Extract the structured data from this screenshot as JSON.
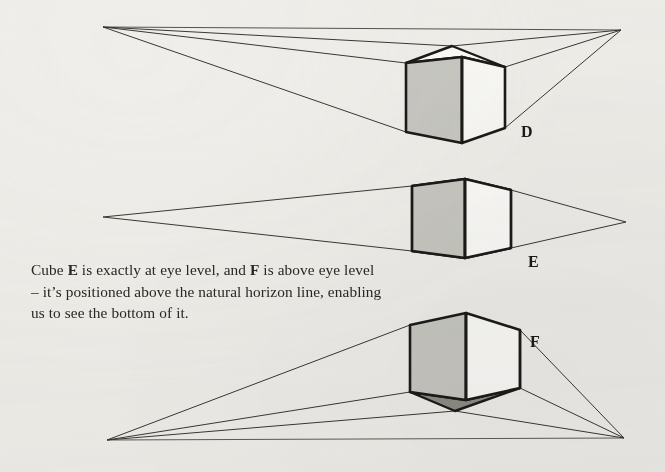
{
  "page": {
    "background_color": "#f2f1ee",
    "width": 665,
    "height": 472,
    "ink_color": "#1d1b19"
  },
  "caption": {
    "line1_a": "Cube ",
    "line1_b": "E",
    "line1_c": " is exactly at eye level, and ",
    "line1_d": "F",
    "line1_e": " is above eye",
    "line2": "level – it’s positioned above the natural horizon",
    "line3": "line, enabling us to see the bottom of it.",
    "full_text": "Cube E is exactly at eye level, and F is above eye level – it’s positioned above the natural horizon line, enabling us to see the bottom of it."
  },
  "figures": [
    {
      "id": "D",
      "label": "D",
      "label_x": 521,
      "label_y": 123,
      "description": "cube below eye level, top face visible",
      "left_vanishing_point": {
        "x": 103,
        "y": 27
      },
      "right_vanishing_point": {
        "x": 621,
        "y": 30
      },
      "cube": {
        "front_top": {
          "x": 462,
          "y": 57
        },
        "front_bottom": {
          "x": 462,
          "y": 143
        },
        "left_top": {
          "x": 406,
          "y": 63
        },
        "left_bottom": {
          "x": 406,
          "y": 132
        },
        "right_top": {
          "x": 505,
          "y": 67
        },
        "right_bottom": {
          "x": 505,
          "y": 128
        },
        "back_top": {
          "x": 452,
          "y": 46
        },
        "left_face_fill": "#c9c9c4",
        "right_face_fill": "#fbfbf9",
        "top_face_fill": "#fdfdfc",
        "bottom_face_fill": null
      }
    },
    {
      "id": "E",
      "label": "E",
      "label_x": 528,
      "label_y": 253,
      "description": "cube exactly at eye level, neither top nor bottom visible",
      "left_vanishing_point": {
        "x": 103,
        "y": 217
      },
      "right_vanishing_point": {
        "x": 626,
        "y": 222
      },
      "cube": {
        "front_top": {
          "x": 465,
          "y": 179
        },
        "front_bottom": {
          "x": 465,
          "y": 258
        },
        "left_top": {
          "x": 412,
          "y": 186
        },
        "left_bottom": {
          "x": 412,
          "y": 251
        },
        "right_top": {
          "x": 511,
          "y": 190
        },
        "right_bottom": {
          "x": 511,
          "y": 248
        },
        "back_top": null,
        "left_face_fill": "#c9c9c4",
        "right_face_fill": "#fdfdfc",
        "top_face_fill": null,
        "bottom_face_fill": null
      }
    },
    {
      "id": "F",
      "label": "F",
      "label_x": 530,
      "label_y": 333,
      "description": "cube above eye level, bottom face visible",
      "left_vanishing_point": {
        "x": 107,
        "y": 440
      },
      "right_vanishing_point": {
        "x": 624,
        "y": 438
      },
      "cube": {
        "front_top": {
          "x": 466,
          "y": 313
        },
        "front_bottom": {
          "x": 466,
          "y": 400
        },
        "left_top": {
          "x": 410,
          "y": 325
        },
        "left_bottom": {
          "x": 410,
          "y": 392
        },
        "right_top": {
          "x": 520,
          "y": 330
        },
        "right_bottom": {
          "x": 520,
          "y": 388
        },
        "back_bottom": {
          "x": 455,
          "y": 411
        },
        "left_face_fill": "#c9c9c4",
        "right_face_fill": "#fdfdfc",
        "top_face_fill": null,
        "bottom_face_fill": "#8e8e88"
      }
    }
  ],
  "style": {
    "cube_outline_color": "#1d1b19",
    "cube_outline_width": 2.6,
    "perspective_line_color": "#3b3834",
    "perspective_line_width": 1.0
  }
}
